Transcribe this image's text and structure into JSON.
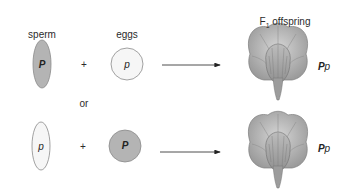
{
  "diagram": {
    "title": "F1 offspring",
    "title_parts": {
      "main": "F",
      "subscript": "1",
      "rest": " offspring"
    },
    "labels": {
      "sperm": "sperm",
      "eggs": "eggs",
      "or": "or",
      "plus": "+"
    },
    "crosses": [
      {
        "sperm": {
          "allele": "P",
          "fill": "#b4b4b4"
        },
        "egg": {
          "allele": "p",
          "fill": "#f6f6f6"
        },
        "offspring_genotype": "Pp",
        "offspring_genotype_parts": {
          "dominant": "P",
          "recessive": "p"
        }
      },
      {
        "sperm": {
          "allele": "p",
          "fill": "#f6f6f6"
        },
        "egg": {
          "allele": "P",
          "fill": "#b4b4b4"
        },
        "offspring_genotype": "Pp",
        "offspring_genotype_parts": {
          "dominant": "P",
          "recessive": "p"
        }
      }
    ],
    "colors": {
      "dominant_gamete": "#b4b4b4",
      "recessive_gamete": "#f6f6f6",
      "outline": "#8a8a8a",
      "flower": "#a9a9a9"
    }
  }
}
